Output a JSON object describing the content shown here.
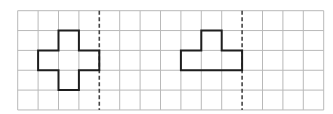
{
  "grid": {
    "origin_x": 17.7,
    "origin_y": 10.7,
    "cell_w": 20.4,
    "cell_h": 19.85,
    "columns": 15,
    "rows": 5,
    "line_color": "#b9b9b9"
  },
  "symmetry_axes": [
    {
      "name": "left-axis",
      "column_line": 4,
      "color": "#444444"
    },
    {
      "name": "right-axis",
      "column_line": 11,
      "color": "#444444"
    }
  ],
  "shapes": [
    {
      "name": "cross-shape",
      "color": "#1e1e1e",
      "cells": [
        [
          2,
          1
        ],
        [
          1,
          2
        ],
        [
          2,
          2
        ],
        [
          3,
          2
        ],
        [
          2,
          3
        ]
      ],
      "outline": [
        [
          2,
          1
        ],
        [
          3,
          1
        ],
        [
          3,
          2
        ],
        [
          4,
          2
        ],
        [
          4,
          3
        ],
        [
          3,
          3
        ],
        [
          3,
          4
        ],
        [
          2,
          4
        ],
        [
          2,
          3
        ],
        [
          1,
          3
        ],
        [
          1,
          2
        ],
        [
          2,
          2
        ]
      ]
    },
    {
      "name": "t-shape",
      "color": "#1e1e1e",
      "cells": [
        [
          9,
          1
        ],
        [
          8,
          2
        ],
        [
          9,
          2
        ],
        [
          10,
          2
        ]
      ],
      "outline": [
        [
          9,
          1
        ],
        [
          10,
          1
        ],
        [
          10,
          2
        ],
        [
          11,
          2
        ],
        [
          11,
          3
        ],
        [
          8,
          3
        ],
        [
          8,
          2
        ],
        [
          9,
          2
        ]
      ]
    }
  ]
}
